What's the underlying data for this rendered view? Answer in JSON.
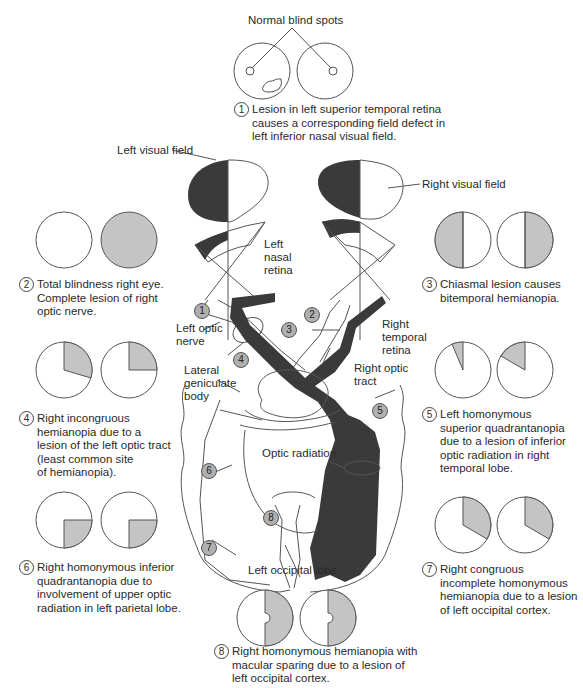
{
  "colors": {
    "dark_fill": "#3a3a3a",
    "defect_gray": "#c4c4c4",
    "outline": "#555555",
    "badge_gray": "#b0b0b0"
  },
  "top": {
    "title": "Normal blind spots"
  },
  "anatomy_labels": {
    "left_visual_field": "Left visual field",
    "right_visual_field": "Right visual field",
    "left_nasal_retina": [
      "Left",
      "nasal",
      "retina"
    ],
    "right_temporal_retina": [
      "Right",
      "temporal",
      "retina"
    ],
    "left_optic_nerve": [
      "Left optic",
      "nerve"
    ],
    "right_optic_tract": [
      "Right optic",
      "tract"
    ],
    "lateral_geniculate_body": [
      "Lateral",
      "geniculate",
      "body"
    ],
    "optic_radiation": "Optic radiation",
    "left_occipital_lobe": "Left occipital lobe"
  },
  "badges": [
    "1",
    "2",
    "3",
    "4",
    "5",
    "6",
    "7",
    "8"
  ],
  "lesions": [
    {
      "num": "1",
      "lines": [
        "Lesion in left superior temporal retina",
        "causes a corresponding field defect in",
        "left inferior nasal visual field."
      ],
      "fields": [
        "normal-with-scotoma",
        "normal"
      ]
    },
    {
      "num": "2",
      "lines": [
        "Total blindness right eye.",
        "Complete lesion of right",
        "optic nerve."
      ],
      "fields": [
        "normal",
        "total"
      ]
    },
    {
      "num": "3",
      "lines": [
        "Chiasmal lesion causes",
        "bitemporal hemianopia."
      ],
      "fields": [
        "left-half",
        "right-half"
      ]
    },
    {
      "num": "4",
      "lines": [
        "Right incongruous",
        "hemianopia due to a",
        "lesion of the left optic tract",
        "(least common site",
        "of hemianopia)."
      ],
      "fields": [
        "upper-right-partial-wedge",
        "upper-right-quadrant"
      ]
    },
    {
      "num": "5",
      "lines": [
        "Left homonymous",
        "superior quadrantanopia",
        "due to a lesion of inferior",
        "optic radiation in right",
        "temporal lobe."
      ],
      "fields": [
        "upper-left-narrow-wedge",
        "upper-left-wedge"
      ]
    },
    {
      "num": "6",
      "lines": [
        "Right homonymous inferior",
        "quadrantanopia due to",
        "involvement of upper optic",
        "radiation in left parietal lobe."
      ],
      "fields": [
        "lower-right-quadrant",
        "lower-right-quadrant"
      ]
    },
    {
      "num": "7",
      "lines": [
        "Right congruous",
        "incomplete homonymous",
        "hemianopia due to a lesion",
        "of left occipital cortex."
      ],
      "fields": [
        "right-wedge-120",
        "right-wedge-120"
      ]
    },
    {
      "num": "8",
      "lines": [
        "Right homonymous hemianopia with",
        "macular sparing due to a lesion of",
        "left occipital cortex."
      ],
      "fields": [
        "right-half-macular-sparing",
        "right-half-macular-sparing"
      ]
    }
  ]
}
